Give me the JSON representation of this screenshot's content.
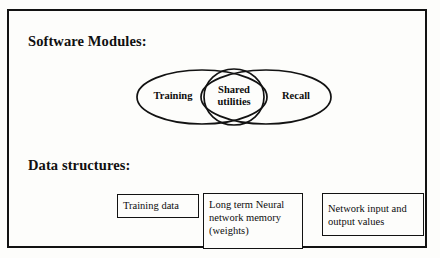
{
  "figure": {
    "type": "architecture-diagram",
    "background_color": "#fdfdfb",
    "line_color": "#121212"
  },
  "sections": {
    "modules_heading": "Software Modules:",
    "data_heading": "Data structures:"
  },
  "venn": {
    "left_ellipse_label": "Training",
    "right_ellipse_label": "Recall",
    "center_ellipse_label_line1": "Shared",
    "center_ellipse_label_line2": "utilities"
  },
  "data_structures": [
    {
      "id": "training-data",
      "lines": [
        "Training data"
      ]
    },
    {
      "id": "long-term-memory",
      "lines": [
        "Long term Neural",
        "network memory",
        "(weights)"
      ]
    },
    {
      "id": "network-io-values",
      "lines": [
        "Network input and",
        "output values"
      ]
    }
  ]
}
